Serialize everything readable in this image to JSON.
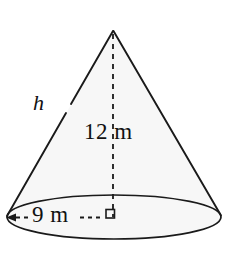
{
  "figure": {
    "name": "cone-diagram",
    "shape": "cone",
    "background_color": "#ffffff",
    "fill_color": "#f7f7f7",
    "stroke_color": "#1a1a1a",
    "labels": {
      "slant_height": "h",
      "vertical_height": "12 m",
      "base_radius": "9 m"
    },
    "annotations": {
      "right_angle_marker": "right-angle-marker",
      "height_line_style": "dashed",
      "radius_line_style": "dashed-with-arrowhead"
    },
    "geometry": {
      "apex_x": 113,
      "apex_y": 30,
      "base_center_x": 114,
      "base_center_y": 218,
      "base_rx": 108,
      "base_ry": 22
    }
  }
}
